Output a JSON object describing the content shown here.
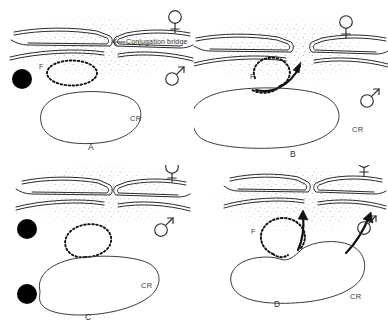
{
  "figure": {
    "title_visible": false,
    "background_color": "#ffffff",
    "ink_color": "#2b2b2b",
    "panel_count": 4
  },
  "annotations": {
    "conjugation_bridge_label": "Conjugation  bridge",
    "chromosome_label": "CR",
    "f_factor_label": "F"
  },
  "symbols": {
    "female": "female-symbol",
    "male": "male-symbol",
    "f_particle": "dashed-circle",
    "granule": "black-filled-circle",
    "transfer_arrow": "curved-arrow"
  },
  "panels": [
    {
      "id": "panel-a",
      "letter": "A",
      "cr_label": "CR",
      "f_label": "F",
      "bridge_label": "Conjugation  bridge",
      "female_symbol": "female-symbol",
      "male_symbol": "male-symbol",
      "granules": 1,
      "arrows": 0,
      "f_attached_to_chromosome": false
    },
    {
      "id": "panel-b",
      "letter": "B",
      "cr_label": "CR",
      "f_label": "F",
      "bridge_label": "",
      "female_symbol": "female-symbol",
      "male_symbol": "male-symbol",
      "granules": 0,
      "arrows": 1,
      "f_attached_to_chromosome": false
    },
    {
      "id": "panel-c",
      "letter": "C",
      "cr_label": "CR",
      "f_label": "",
      "bridge_label": "",
      "female_symbol": "female-symbol",
      "male_symbol": "male-symbol",
      "granules": 2,
      "arrows": 0,
      "f_attached_to_chromosome": true
    },
    {
      "id": "panel-d",
      "letter": "D",
      "cr_label": "CR",
      "f_label": "F",
      "bridge_label": "",
      "female_symbol": "female-symbol",
      "male_symbol": "male-symbol",
      "granules": 0,
      "arrows": 2,
      "f_attached_to_chromosome": true
    }
  ]
}
